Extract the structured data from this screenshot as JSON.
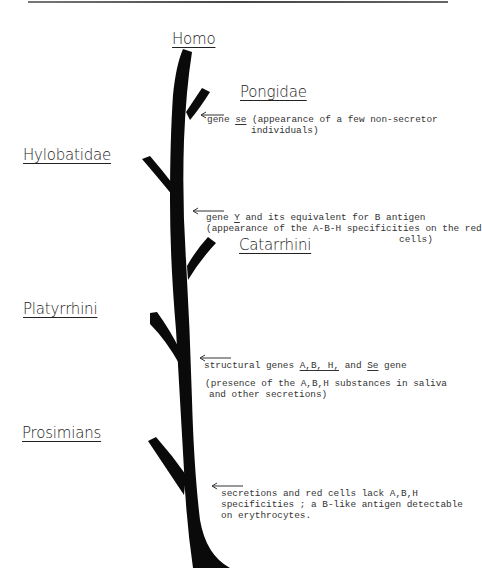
{
  "diagram": {
    "type": "phylogenetic-tree"
  },
  "taxa": {
    "homo": "Homo",
    "pongidae": "Pongidae",
    "hylobatidae": "Hylobatidae",
    "catarrhini": "Catarrhini",
    "platyrrhini": "Platyrrhini",
    "prosimians": "Prosimians"
  },
  "annotations": {
    "se_gene": {
      "line1_pre": "gene ",
      "line1_gene": "se",
      "line1_post": " (appearance of a few non-secretor",
      "line2": "individuals)"
    },
    "y_gene": {
      "line1_pre": "gene ",
      "line1_gene": "Y",
      "line1_post": " and its equivalent for B antigen",
      "line2": "(appearance of the A-B-H specificities on the red",
      "line3": "cells)"
    },
    "structural_genes": {
      "line1_pre": "structural genes ",
      "line1_genes": "A,B, H,",
      "line1_mid": " and ",
      "line1_se": "Se",
      "line1_post": " gene",
      "line2": "(presence of the A,B,H substances in saliva",
      "line3": "and other secretions)"
    },
    "prosimian_note": {
      "line1": "secretions and red cells lack A,B,H",
      "line2": "specificities ; a B-like antigen detectable",
      "line3": "on erythrocytes."
    }
  },
  "colors": {
    "tree": "#0a0a0a",
    "text": "#333333",
    "background": "#ffffff"
  }
}
